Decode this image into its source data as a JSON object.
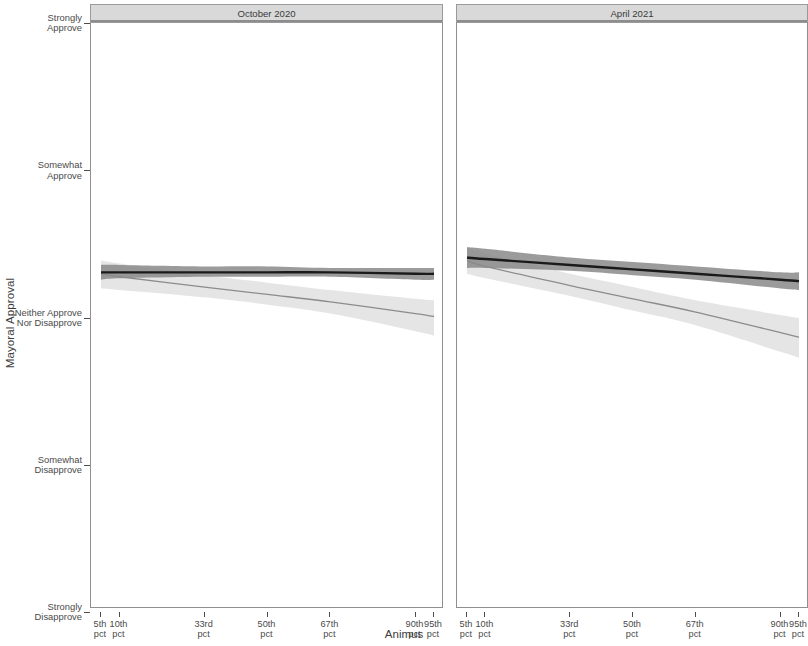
{
  "chart_data": {
    "type": "line",
    "title": "",
    "xlabel": "Animus",
    "ylabel": "Mayoral Approval",
    "legend_position": "none",
    "grid": false,
    "facet_variable": "survey_wave",
    "y_categories": [
      "Strongly Disapprove",
      "Somewhat Disapprove",
      "Neither Approve Nor Disapprove",
      "Somewhat Approve",
      "Strongly Approve"
    ],
    "ylim": [
      1,
      5
    ],
    "y_tick_labels": [
      {
        "label_line1": "Strongly",
        "label_line2": "Approve",
        "value": 5
      },
      {
        "label_line1": "Somewhat",
        "label_line2": "Approve",
        "value": 4
      },
      {
        "label_line1": "Neither Approve",
        "label_line2": "Nor Disapprove",
        "value": 3
      },
      {
        "label_line1": "Somewhat",
        "label_line2": "Disapprove",
        "value": 2
      },
      {
        "label_line1": "Strongly",
        "label_line2": "Disapprove",
        "value": 1
      }
    ],
    "x_tick_labels": [
      {
        "label_line1": "5th",
        "label_line2": "pct",
        "value": 5
      },
      {
        "label_line1": "10th",
        "label_line2": "pct",
        "value": 10
      },
      {
        "label_line1": "33rd",
        "label_line2": "pct",
        "value": 33
      },
      {
        "label_line1": "50th",
        "label_line2": "pct",
        "value": 50
      },
      {
        "label_line1": "67th",
        "label_line2": "pct",
        "value": 67
      },
      {
        "label_line1": "90th",
        "label_line2": "pct",
        "value": 90
      },
      {
        "label_line1": "95th",
        "label_line2": "pct",
        "value": 95
      }
    ],
    "xlim": [
      5,
      95
    ],
    "series_colors": {
      "dark_line": "#1a1a1a",
      "dark_band": "#8a8a8a",
      "light_line": "#8c8c8c",
      "light_band": "#e2e2e2"
    },
    "panels": [
      {
        "label": "October 2020",
        "series": [
          {
            "name": "dark",
            "x": [
              5,
              10,
              33,
              50,
              67,
              90,
              95
            ],
            "values": [
              3.3,
              3.3,
              3.3,
              3.3,
              3.3,
              3.29,
              3.29
            ],
            "ci_low": [
              3.25,
              3.26,
              3.27,
              3.27,
              3.27,
              3.25,
              3.25
            ],
            "ci_high": [
              3.35,
              3.35,
              3.34,
              3.34,
              3.33,
              3.33,
              3.33
            ]
          },
          {
            "name": "light",
            "x": [
              5,
              10,
              33,
              50,
              67,
              90,
              95
            ],
            "values": [
              3.29,
              3.27,
              3.2,
              3.15,
              3.1,
              3.02,
              3.0
            ],
            "ci_low": [
              3.19,
              3.18,
              3.13,
              3.08,
              3.02,
              2.9,
              2.87
            ],
            "ci_high": [
              3.38,
              3.36,
              3.28,
              3.23,
              3.18,
              3.12,
              3.11
            ]
          }
        ]
      },
      {
        "label": "April 2021",
        "series": [
          {
            "name": "dark",
            "x": [
              5,
              10,
              33,
              50,
              67,
              90,
              95
            ],
            "values": [
              3.4,
              3.39,
              3.35,
              3.32,
              3.29,
              3.25,
              3.24
            ],
            "ci_low": [
              3.33,
              3.33,
              3.31,
              3.28,
              3.25,
              3.19,
              3.18
            ],
            "ci_high": [
              3.47,
              3.46,
              3.4,
              3.37,
              3.34,
              3.3,
              3.3
            ]
          },
          {
            "name": "light",
            "x": [
              5,
              10,
              33,
              50,
              67,
              90,
              95
            ],
            "values": [
              3.38,
              3.34,
              3.21,
              3.12,
              3.03,
              2.89,
              2.86
            ],
            "ci_low": [
              3.29,
              3.26,
              3.14,
              3.04,
              2.94,
              2.76,
              2.72
            ],
            "ci_high": [
              3.47,
              3.43,
              3.29,
              3.2,
              3.11,
              3.01,
              2.99
            ]
          }
        ]
      }
    ]
  },
  "axes": {
    "y_title": "Mayoral Approval",
    "x_title": "Animus"
  }
}
